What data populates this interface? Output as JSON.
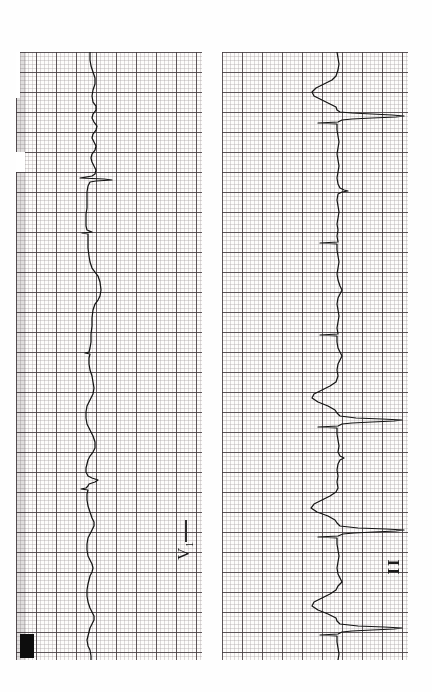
{
  "page": {
    "background_color": "#ffffff",
    "paper_color": "#fdfcfb",
    "trace_color": "#131313",
    "grid_fine_color": "#786e73",
    "grid_bold_color": "#463e42",
    "orientation": "rotated-90-ccw"
  },
  "strips": [
    {
      "id": "strip-left",
      "lead_label": "V",
      "lead_subscript": "1",
      "lead_label_full": "V1",
      "x": 16,
      "y": 52,
      "width": 186,
      "height": 608,
      "baseline_px": 74,
      "has_calibration_block": true,
      "calibration_block": {
        "x": 4,
        "y": 582,
        "width": 14,
        "height": 24
      }
    },
    {
      "id": "strip-right",
      "lead_label": "II",
      "lead_subscript": "",
      "lead_label_full": "II",
      "x": 222,
      "y": 52,
      "width": 186,
      "height": 608,
      "baseline_px": 115,
      "has_calibration_block": false
    }
  ],
  "chart_data": {
    "type": "line",
    "xlabel": "Time (paper advances downward)",
    "ylabel": "Amplitude (deflection to the right)",
    "grid": true,
    "legend": "none",
    "paper_speed": "25 mm/s",
    "small_square_px": 4,
    "large_square_px": 20,
    "series": [
      {
        "name": "V1",
        "lead": "V1",
        "baseline_x_px": 90,
        "description": "Low-amplitude rSr pattern with broad deflections and intermittent pacing-like spikes",
        "points": [
          [
            90,
            52
          ],
          [
            90,
            60
          ],
          [
            91,
            66
          ],
          [
            93,
            72
          ],
          [
            95,
            78
          ],
          [
            95,
            84
          ],
          [
            93,
            90
          ],
          [
            92,
            96
          ],
          [
            93,
            102
          ],
          [
            96,
            106
          ],
          [
            96,
            110
          ],
          [
            93,
            114
          ],
          [
            92,
            118
          ],
          [
            94,
            122
          ],
          [
            97,
            126
          ],
          [
            96,
            130
          ],
          [
            93,
            134
          ],
          [
            92,
            138
          ],
          [
            94,
            142
          ],
          [
            96,
            146
          ],
          [
            95,
            150
          ],
          [
            92,
            154
          ],
          [
            91,
            158
          ],
          [
            92,
            162
          ],
          [
            94,
            166
          ],
          [
            96,
            170
          ],
          [
            95,
            174
          ],
          [
            92,
            176
          ],
          [
            80,
            178
          ],
          [
            104,
            179
          ],
          [
            112,
            180
          ],
          [
            96,
            181
          ],
          [
            90,
            182
          ],
          [
            88,
            186
          ],
          [
            87,
            192
          ],
          [
            87,
            200
          ],
          [
            87,
            208
          ],
          [
            86,
            214
          ],
          [
            86,
            220
          ],
          [
            86,
            226
          ],
          [
            87,
            230
          ],
          [
            92,
            232
          ],
          [
            82,
            233
          ],
          [
            88,
            234
          ],
          [
            88,
            240
          ],
          [
            88,
            248
          ],
          [
            89,
            256
          ],
          [
            90,
            262
          ],
          [
            92,
            268
          ],
          [
            95,
            272
          ],
          [
            98,
            276
          ],
          [
            100,
            282
          ],
          [
            101,
            290
          ],
          [
            100,
            296
          ],
          [
            98,
            300
          ],
          [
            95,
            304
          ],
          [
            93,
            310
          ],
          [
            92,
            318
          ],
          [
            92,
            326
          ],
          [
            91,
            334
          ],
          [
            91,
            342
          ],
          [
            90,
            348
          ],
          [
            89,
            352
          ],
          [
            85,
            353
          ],
          [
            90,
            354
          ],
          [
            89,
            358
          ],
          [
            89,
            364
          ],
          [
            90,
            370
          ],
          [
            92,
            376
          ],
          [
            93,
            382
          ],
          [
            94,
            388
          ],
          [
            93,
            394
          ],
          [
            91,
            398
          ],
          [
            89,
            402
          ],
          [
            87,
            406
          ],
          [
            86,
            412
          ],
          [
            86,
            418
          ],
          [
            87,
            424
          ],
          [
            90,
            430
          ],
          [
            93,
            436
          ],
          [
            95,
            442
          ],
          [
            95,
            448
          ],
          [
            93,
            452
          ],
          [
            90,
            456
          ],
          [
            88,
            460
          ],
          [
            87,
            464
          ],
          [
            86,
            468
          ],
          [
            86,
            472
          ],
          [
            88,
            476
          ],
          [
            92,
            478
          ],
          [
            98,
            480
          ],
          [
            95,
            482
          ],
          [
            89,
            484
          ],
          [
            88,
            486
          ],
          [
            86,
            488
          ],
          [
            81,
            489
          ],
          [
            88,
            490
          ],
          [
            87,
            494
          ],
          [
            87,
            500
          ],
          [
            88,
            506
          ],
          [
            90,
            512
          ],
          [
            92,
            518
          ],
          [
            94,
            522
          ],
          [
            94,
            526
          ],
          [
            92,
            530
          ],
          [
            90,
            534
          ],
          [
            88,
            538
          ],
          [
            87,
            544
          ],
          [
            87,
            550
          ],
          [
            88,
            556
          ],
          [
            90,
            560
          ],
          [
            92,
            564
          ],
          [
            93,
            568
          ],
          [
            92,
            572
          ],
          [
            90,
            576
          ],
          [
            89,
            580
          ],
          [
            88,
            584
          ],
          [
            87,
            590
          ],
          [
            87,
            596
          ],
          [
            88,
            602
          ],
          [
            90,
            608
          ],
          [
            92,
            612
          ],
          [
            94,
            616
          ],
          [
            94,
            620
          ],
          [
            92,
            624
          ],
          [
            90,
            628
          ],
          [
            89,
            632
          ],
          [
            88,
            636
          ],
          [
            87,
            640
          ],
          [
            88,
            646
          ],
          [
            90,
            650
          ],
          [
            91,
            656
          ],
          [
            91,
            660
          ]
        ]
      },
      {
        "name": "II",
        "lead": "II",
        "baseline_x_px": 337,
        "description": "Tall upright R waves with wide QRS complexes and deep preceding troughs",
        "points": [
          [
            337,
            52
          ],
          [
            338,
            58
          ],
          [
            339,
            64
          ],
          [
            338,
            70
          ],
          [
            336,
            76
          ],
          [
            332,
            80
          ],
          [
            324,
            84
          ],
          [
            316,
            88
          ],
          [
            312,
            92
          ],
          [
            314,
            96
          ],
          [
            322,
            100
          ],
          [
            330,
            104
          ],
          [
            336,
            107
          ],
          [
            337,
            110
          ],
          [
            340,
            112
          ],
          [
            352,
            113
          ],
          [
            372,
            114
          ],
          [
            392,
            115
          ],
          [
            404,
            116
          ],
          [
            396,
            117
          ],
          [
            372,
            118
          ],
          [
            352,
            119
          ],
          [
            342,
            120
          ],
          [
            338,
            122
          ],
          [
            318,
            123
          ],
          [
            337,
            124
          ],
          [
            337,
            130
          ],
          [
            338,
            136
          ],
          [
            339,
            142
          ],
          [
            338,
            148
          ],
          [
            337,
            154
          ],
          [
            338,
            160
          ],
          [
            339,
            166
          ],
          [
            338,
            172
          ],
          [
            337,
            178
          ],
          [
            338,
            184
          ],
          [
            340,
            188
          ],
          [
            344,
            190
          ],
          [
            348,
            191
          ],
          [
            342,
            192
          ],
          [
            338,
            194
          ],
          [
            337,
            200
          ],
          [
            338,
            206
          ],
          [
            339,
            212
          ],
          [
            338,
            218
          ],
          [
            337,
            224
          ],
          [
            338,
            230
          ],
          [
            337,
            236
          ],
          [
            338,
            242
          ],
          [
            320,
            243
          ],
          [
            337,
            244
          ],
          [
            337,
            250
          ],
          [
            338,
            256
          ],
          [
            339,
            262
          ],
          [
            338,
            268
          ],
          [
            337,
            274
          ],
          [
            338,
            280
          ],
          [
            340,
            286
          ],
          [
            342,
            290
          ],
          [
            340,
            294
          ],
          [
            338,
            298
          ],
          [
            337,
            304
          ],
          [
            338,
            310
          ],
          [
            339,
            316
          ],
          [
            338,
            322
          ],
          [
            337,
            328
          ],
          [
            338,
            334
          ],
          [
            320,
            335
          ],
          [
            337,
            336
          ],
          [
            337,
            342
          ],
          [
            338,
            348
          ],
          [
            340,
            352
          ],
          [
            342,
            356
          ],
          [
            340,
            360
          ],
          [
            338,
            364
          ],
          [
            337,
            370
          ],
          [
            338,
            376
          ],
          [
            336,
            382
          ],
          [
            330,
            386
          ],
          [
            322,
            390
          ],
          [
            314,
            394
          ],
          [
            312,
            398
          ],
          [
            318,
            402
          ],
          [
            328,
            406
          ],
          [
            335,
            410
          ],
          [
            337,
            413
          ],
          [
            340,
            416
          ],
          [
            356,
            418
          ],
          [
            382,
            419
          ],
          [
            402,
            420
          ],
          [
            394,
            421
          ],
          [
            372,
            422
          ],
          [
            352,
            423
          ],
          [
            342,
            424
          ],
          [
            338,
            426
          ],
          [
            318,
            427
          ],
          [
            337,
            428
          ],
          [
            337,
            434
          ],
          [
            338,
            440
          ],
          [
            339,
            446
          ],
          [
            338,
            452
          ],
          [
            340,
            456
          ],
          [
            344,
            458
          ],
          [
            340,
            460
          ],
          [
            338,
            464
          ],
          [
            337,
            470
          ],
          [
            338,
            476
          ],
          [
            337,
            482
          ],
          [
            338,
            488
          ],
          [
            336,
            492
          ],
          [
            330,
            496
          ],
          [
            322,
            500
          ],
          [
            314,
            504
          ],
          [
            311,
            508
          ],
          [
            317,
            512
          ],
          [
            328,
            516
          ],
          [
            335,
            520
          ],
          [
            337,
            523
          ],
          [
            340,
            526
          ],
          [
            358,
            528
          ],
          [
            386,
            529
          ],
          [
            404,
            530
          ],
          [
            396,
            531
          ],
          [
            374,
            532
          ],
          [
            354,
            533
          ],
          [
            343,
            534
          ],
          [
            338,
            536
          ],
          [
            318,
            537
          ],
          [
            337,
            538
          ],
          [
            337,
            544
          ],
          [
            338,
            550
          ],
          [
            339,
            556
          ],
          [
            338,
            562
          ],
          [
            337,
            568
          ],
          [
            338,
            574
          ],
          [
            340,
            578
          ],
          [
            342,
            582
          ],
          [
            338,
            586
          ],
          [
            336,
            590
          ],
          [
            330,
            594
          ],
          [
            322,
            598
          ],
          [
            314,
            602
          ],
          [
            312,
            606
          ],
          [
            318,
            610
          ],
          [
            328,
            614
          ],
          [
            336,
            618
          ],
          [
            337,
            621
          ],
          [
            340,
            624
          ],
          [
            358,
            626
          ],
          [
            384,
            627
          ],
          [
            402,
            628
          ],
          [
            394,
            629
          ],
          [
            372,
            630
          ],
          [
            352,
            631
          ],
          [
            342,
            632
          ],
          [
            338,
            634
          ],
          [
            320,
            635
          ],
          [
            337,
            636
          ],
          [
            337,
            642
          ],
          [
            338,
            648
          ],
          [
            339,
            654
          ],
          [
            338,
            660
          ]
        ]
      }
    ]
  }
}
